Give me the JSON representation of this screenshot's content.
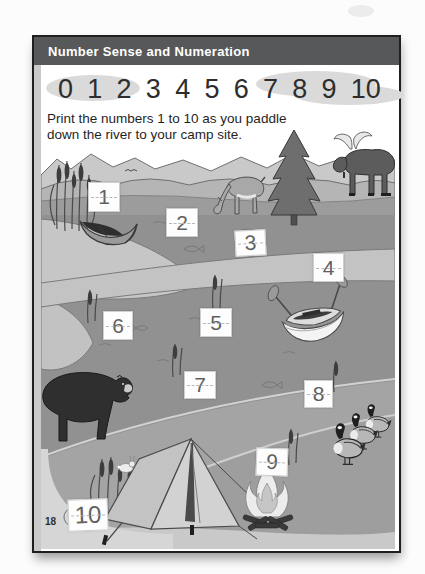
{
  "header": {
    "title": "Number Sense and Numeration"
  },
  "number_chart": {
    "digits": [
      "0",
      "1",
      "2",
      "3",
      "4",
      "5",
      "6",
      "7",
      "8",
      "9",
      "10"
    ]
  },
  "instructions": {
    "line1": "Print the numbers 1 to 10 as you paddle",
    "line2": "down the river to your camp site."
  },
  "trace_boxes": [
    "1",
    "2",
    "3",
    "4",
    "5",
    "6",
    "7",
    "8",
    "9",
    "10"
  ],
  "page_number": "18",
  "scene": {
    "elements": [
      "mountains",
      "hills",
      "river",
      "sandbar",
      "cattails",
      "canoe",
      "deer",
      "pine-tree",
      "moose",
      "rowboat",
      "bear",
      "geese",
      "tent",
      "campfire",
      "fish",
      "rock",
      "rabbit",
      "bird",
      "water-ripples"
    ],
    "colors": {
      "header_bar": "#57585a",
      "page_border": "#1f1f1f",
      "cloud": "#dadada",
      "water": "#919191",
      "sand": "#c3c3c3",
      "ground": "#a4a4a4",
      "box_numeral": "#616161"
    }
  }
}
